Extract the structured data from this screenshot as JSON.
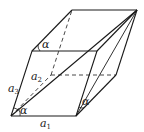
{
  "figure": {
    "type": "parallelepiped",
    "stroke_color": "#1a1a1a",
    "background": "#ffffff"
  },
  "labels": {
    "a1": {
      "base": "a",
      "sub": "1"
    },
    "a2": {
      "base": "a",
      "sub": "2"
    },
    "a3": {
      "base": "a",
      "sub": "3"
    },
    "alpha_top": "α",
    "alpha_right": "α",
    "alpha_bottom": "α"
  }
}
